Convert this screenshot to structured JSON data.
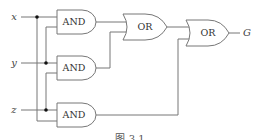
{
  "diagram": {
    "type": "logic-circuit",
    "inputs": [
      {
        "label": "x"
      },
      {
        "label": "y"
      },
      {
        "label": "z"
      }
    ],
    "gates": [
      {
        "id": "and1",
        "type": "AND",
        "label": "AND",
        "inputs": [
          "x",
          "y"
        ]
      },
      {
        "id": "and2",
        "type": "AND",
        "label": "AND",
        "inputs": [
          "y",
          "z"
        ]
      },
      {
        "id": "and3",
        "type": "AND",
        "label": "AND",
        "inputs": [
          "z",
          "x"
        ]
      },
      {
        "id": "or1",
        "type": "OR",
        "label": "OR",
        "inputs": [
          "and1",
          "and2"
        ]
      },
      {
        "id": "or2",
        "type": "OR",
        "label": "OR",
        "inputs": [
          "or1",
          "and3"
        ]
      }
    ],
    "output": {
      "label": "G"
    },
    "caption": "图 3.1",
    "colors": {
      "wire": "#777777",
      "junction": "#111111",
      "background": "#ffffff"
    }
  }
}
